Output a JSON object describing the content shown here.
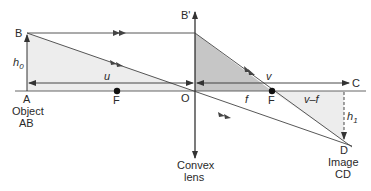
{
  "diagram": {
    "type": "convex-lens-ray-diagram",
    "points": {
      "B": "B",
      "A": "A",
      "B_prime": "B'",
      "O": "O",
      "F_left": "F",
      "F_right": "F",
      "C": "C",
      "D": "D"
    },
    "labels": {
      "h0": "h",
      "h0_sub": "0",
      "h1": "h",
      "h1_sub": "1",
      "u": "u",
      "v": "v",
      "f": "f",
      "v_minus_f": "v–f"
    },
    "captions": {
      "object_line1": "Object",
      "object_line2": "AB",
      "lens_line1": "Convex",
      "lens_line2": "lens",
      "image_line1": "Image",
      "image_line2": "CD"
    },
    "colors": {
      "line": "#333333",
      "light_shade": "#ececec",
      "dark_shade": "#c4c4c4",
      "focal_point": "#111111"
    }
  }
}
